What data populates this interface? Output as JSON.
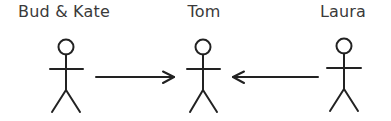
{
  "diagram": {
    "type": "use-case actors / relationship",
    "actors": [
      {
        "id": "bud-kate",
        "label": "Bud & Kate",
        "cx": 66
      },
      {
        "id": "tom",
        "label": "Tom",
        "cx": 203
      },
      {
        "id": "laura",
        "label": "Laura",
        "cx": 344
      }
    ],
    "edges": [
      {
        "from": "Bud & Kate",
        "to": "Tom",
        "direction": "right"
      },
      {
        "from": "Laura",
        "to": "Tom",
        "direction": "left"
      }
    ],
    "colors": {
      "line": "#222222",
      "text": "#3a3a3a",
      "background": "#ffffff"
    }
  }
}
